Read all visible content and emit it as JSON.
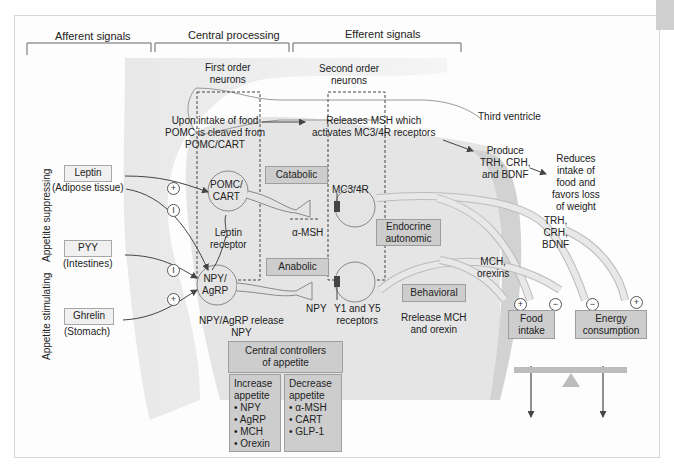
{
  "headers": {
    "afferent": "Afferent signals",
    "central": "Central processing",
    "efferent": "Efferent signals"
  },
  "neurons": {
    "first_order": [
      "First order",
      "neurons"
    ],
    "second_order": [
      "Second order",
      "neurons"
    ]
  },
  "annotations": {
    "pomc_intake": [
      "Upon intake of food",
      "POMC is cleaved from",
      "POMC/CART"
    ],
    "releases_msh": [
      "Releases MSH which",
      "activates MC3/4R receptors"
    ],
    "third_ventricle": "Third ventricle",
    "produce": [
      "Produce",
      "TRH, CRH,",
      "and BDNF"
    ],
    "reduces": [
      "Reduces",
      "intake of",
      "food and",
      "favors loss",
      "of weight"
    ],
    "trh_crh_bdnf": [
      "TRH,",
      "CRH,",
      "BDNF"
    ],
    "mch_orexins": [
      "MCH,",
      "orexins"
    ],
    "leptin_receptor": [
      "Leptin",
      "receptor"
    ],
    "alpha_msh": "α-MSH",
    "mc34r": "MC3/4R",
    "npy": "NPY",
    "npy_agrp_release": [
      "NPY/AgRP release",
      "NPY"
    ],
    "y1_y5": [
      "Y1 and Y5",
      "receptors"
    ],
    "release_mch": [
      "Rrelease MCH",
      "and orexin"
    ]
  },
  "cells": {
    "pomc": [
      "POMC/",
      "CART"
    ],
    "npy_agrp": [
      "NPY/",
      "AgRP"
    ]
  },
  "pathway_boxes": {
    "catabolic": "Catabolic",
    "anabolic": "Anabolic",
    "endocrine": [
      "Endocrine",
      "autonomic"
    ],
    "behavioral": "Behavioral"
  },
  "signals": [
    {
      "name": "Leptin",
      "source": "(Adipose tissue)"
    },
    {
      "name": "PYY",
      "source": "(Intestines)"
    },
    {
      "name": "Ghrelin",
      "source": "(Stomach)"
    }
  ],
  "side_labels": {
    "suppressing": "Appetite suppressing",
    "stimulating": "Appetite stimulating"
  },
  "signs": {
    "plus": "+",
    "minus": "−",
    "inhibit": "I"
  },
  "outcomes": {
    "food_intake": [
      "Food",
      "intake"
    ],
    "energy_consumption": [
      "Energy",
      "consumption"
    ]
  },
  "central_controllers": {
    "title": [
      "Central controllers",
      "of appetite"
    ],
    "increase": {
      "title": [
        "Increase",
        "appetite"
      ],
      "items": [
        "• NPY",
        "• AgRP",
        "• MCH",
        "• Orexin"
      ]
    },
    "decrease": {
      "title": [
        "Decrease",
        "appetite"
      ],
      "items": [
        "• α-MSH",
        "• CART",
        "• GLP-1"
      ]
    }
  },
  "colors": {
    "box_fill": "#cdcdcd",
    "region_fill": "#dcdcdc",
    "cell_fill": "#e4e4e4",
    "line": "#555555"
  }
}
